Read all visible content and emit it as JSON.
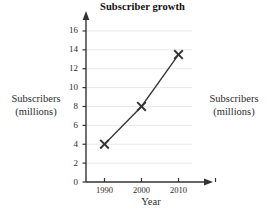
{
  "figure": {
    "title": "Subscriber growth",
    "left_annotation": {
      "line1": "Subscribers",
      "line2": "(millions)"
    },
    "right_annotation": {
      "line1": "Subscribers",
      "line2": "(millions)"
    }
  },
  "chart_data": {
    "type": "line",
    "title": "Subscriber growth",
    "xlabel": "Year",
    "ylabel": "Subscribers (millions)",
    "x": [
      1990,
      2000,
      2010
    ],
    "values": [
      4,
      8,
      13.5
    ],
    "series": [
      {
        "name": "Subscribers (millions)",
        "values": [
          4,
          8,
          13.5
        ]
      }
    ],
    "xlim": [
      1985,
      2020
    ],
    "ylim": [
      0,
      17
    ],
    "xticks": [
      1990,
      2000,
      2010,
      2020
    ],
    "xtick_labels": [
      "1990",
      "2000",
      "2010",
      ""
    ],
    "yticks": [
      0,
      2,
      4,
      6,
      8,
      10,
      12,
      14,
      16
    ],
    "ytick_labels": [
      "0",
      "2",
      "4",
      "6",
      "8",
      "10",
      "12",
      "14",
      "16"
    ],
    "grid": "horizontal",
    "legend": "none",
    "marker": "x",
    "line_color": "#333333",
    "grid_color": "#e8e8e8",
    "axis_color": "#333333"
  }
}
